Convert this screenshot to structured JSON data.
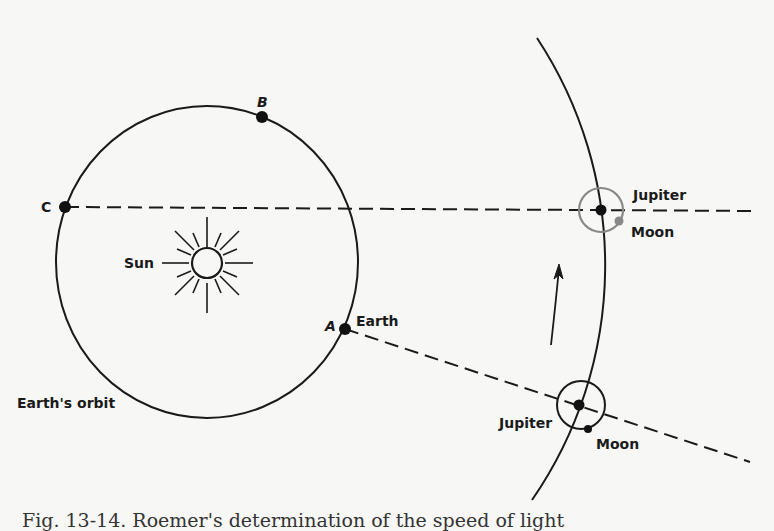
{
  "figure": {
    "caption": "Fig. 13-14. Roemer's determination of the speed of light",
    "labels": {
      "point_b": "B",
      "point_c": "C",
      "point_a": "A",
      "earth": "Earth",
      "sun": "Sun",
      "earths_orbit": "Earth's orbit",
      "jupiter_top": "Jupiter",
      "moon_top": "Moon",
      "jupiter_bottom": "Jupiter",
      "moon_bottom": "Moon"
    },
    "colors": {
      "ink": "#1a1a1a",
      "moon_gray": "#888888",
      "background": "#f7f7f5"
    }
  }
}
